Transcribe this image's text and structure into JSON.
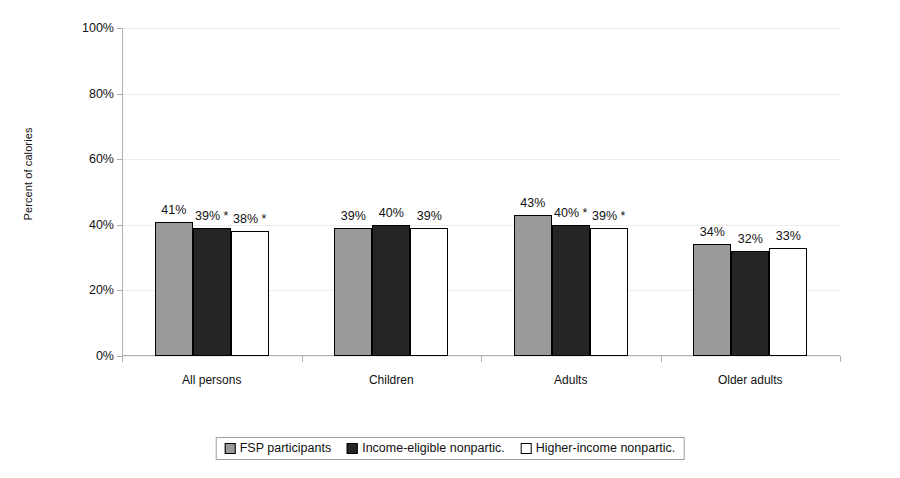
{
  "chart_data": {
    "type": "bar",
    "title": "",
    "subtitle": "",
    "xlabel": "",
    "ylabel": "Percent of calories",
    "ylim": [
      0,
      100
    ],
    "y_tick_labels": [
      "0%",
      "20%",
      "40%",
      "60%",
      "80%",
      "100%"
    ],
    "y_ticks": [
      0,
      20,
      40,
      60,
      80,
      100
    ],
    "grid": true,
    "legend_position": "bottom",
    "categories": [
      "All persons",
      "Children",
      "Adults",
      "Older adults"
    ],
    "series": [
      {
        "name": "FSP participants",
        "color": "#9a9a9a",
        "values": [
          41,
          39,
          43,
          34
        ],
        "labels": [
          "41%",
          "39%",
          "43%",
          "34%"
        ]
      },
      {
        "name": "Income-eligible nonpartic.",
        "color": "#252525",
        "values": [
          39,
          40,
          40,
          32
        ],
        "labels": [
          "39% *",
          "40%",
          "40% *",
          "32%"
        ]
      },
      {
        "name": "Higher-income nonpartic.",
        "color": "#ffffff",
        "values": [
          38,
          39,
          39,
          33
        ],
        "labels": [
          "38% *",
          "39%",
          "39% *",
          "33%"
        ]
      }
    ]
  },
  "legend": {
    "items": [
      {
        "label": "FSP participants"
      },
      {
        "label": "Income-eligible nonpartic."
      },
      {
        "label": "Higher-income nonpartic."
      }
    ]
  }
}
